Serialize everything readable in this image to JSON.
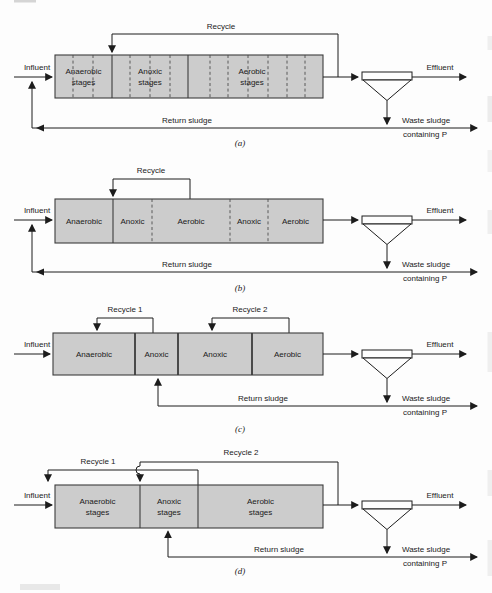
{
  "colors": {
    "tank_fill": "#cccccc",
    "tank_border": "#3c3c3c",
    "line": "#1c1c1c",
    "background": "#fdfdfd"
  },
  "panels": {
    "a": {
      "tag": "(a)",
      "recycle_label": "Recycle",
      "influent_label": "Influent",
      "effluent_label": "Effluent",
      "return_sludge_label": "Return sludge",
      "waste_sludge_label_line1": "Waste sludge",
      "waste_sludge_label_line2": "containing P",
      "zones": [
        {
          "line1": "Anaerobic",
          "line2": "stages"
        },
        {
          "line1": "Anoxic",
          "line2": "stages"
        },
        {
          "line1": "Aerobic",
          "line2": "stages"
        }
      ]
    },
    "b": {
      "tag": "(b)",
      "recycle_label": "Recycle",
      "influent_label": "Influent",
      "effluent_label": "Effluent",
      "return_sludge_label": "Return sludge",
      "waste_sludge_label_line1": "Waste sludge",
      "waste_sludge_label_line2": "containing P",
      "zones": [
        {
          "line1": "Anaerobic"
        },
        {
          "line1": "Anoxic"
        },
        {
          "line1": "Aerobic"
        },
        {
          "line1": "Anoxic"
        },
        {
          "line1": "Aerobic"
        }
      ]
    },
    "c": {
      "tag": "(c)",
      "recycle1_label": "Recycle 1",
      "recycle2_label": "Recycle 2",
      "influent_label": "Influent",
      "effluent_label": "Effluent",
      "return_sludge_label": "Return sludge",
      "waste_sludge_label_line1": "Waste sludge",
      "waste_sludge_label_line2": "containing P",
      "zones": [
        {
          "line1": "Anaerobic"
        },
        {
          "line1": "Anoxic"
        },
        {
          "line1": "Anoxic"
        },
        {
          "line1": "Aerobic"
        }
      ]
    },
    "d": {
      "tag": "(d)",
      "recycle1_label": "Recycle 1",
      "recycle2_label": "Recycle 2",
      "influent_label": "Influent",
      "effluent_label": "Effluent",
      "return_sludge_label": "Return sludge",
      "waste_sludge_label_line1": "Waste sludge",
      "waste_sludge_label_line2": "containing P",
      "zones": [
        {
          "line1": "Anaerobic",
          "line2": "stages"
        },
        {
          "line1": "Anoxic",
          "line2": "stages"
        },
        {
          "line1": "Aerobic",
          "line2": "stages"
        }
      ]
    }
  }
}
